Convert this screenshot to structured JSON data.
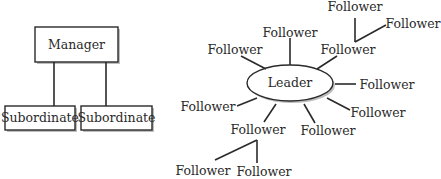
{
  "hierarchy": {
    "top": "Manager",
    "children": [
      "Subordinate",
      "Subordinate"
    ]
  },
  "network": {
    "center": "Leader",
    "followers": [
      "Follower",
      "Follower",
      "Follower",
      "Follower",
      "Follower",
      "Follower",
      "Follower",
      "Follower",
      "Follower",
      "Follower",
      "Follower",
      "Follower"
    ]
  },
  "colors": {
    "stroke": "#2a2a2a",
    "background": "#ffffff"
  }
}
